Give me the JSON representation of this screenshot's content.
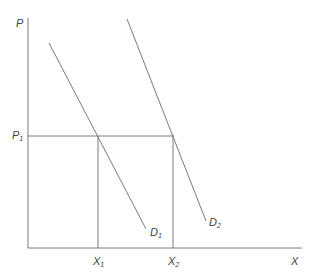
{
  "diagram": {
    "type": "supply-demand",
    "axes": {
      "y_label": "P",
      "x_label": "X"
    },
    "price_level": {
      "label": "P",
      "subscript": "1"
    },
    "quantities": [
      {
        "label": "X",
        "subscript": "1"
      },
      {
        "label": "X",
        "subscript": "2"
      }
    ],
    "curves": [
      {
        "name": "D",
        "subscript": "1",
        "description": "demand curve 1"
      },
      {
        "name": "D",
        "subscript": "2",
        "description": "demand curve 2 (shifted right)"
      }
    ],
    "colors": {
      "line": "#7a7a7a",
      "text": "#444444",
      "background": "#ffffff"
    }
  }
}
